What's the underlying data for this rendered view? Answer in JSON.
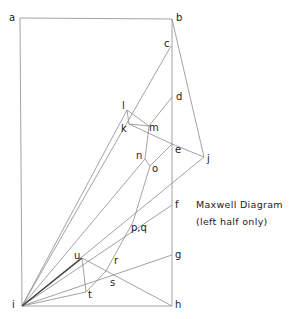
{
  "caption": {
    "title": "Maxwell Diagram",
    "subtitle": "(left half only)"
  },
  "points": {
    "a": {
      "label": "a",
      "x": 20,
      "y": 18,
      "lx": 9,
      "ly": 21
    },
    "b": {
      "label": "b",
      "x": 172,
      "y": 19,
      "lx": 176,
      "ly": 21
    },
    "c": {
      "label": "c",
      "x": 171,
      "y": 46,
      "lx": 164,
      "ly": 47
    },
    "d": {
      "label": "d",
      "x": 172,
      "y": 97,
      "lx": 176,
      "ly": 100
    },
    "e": {
      "label": "e",
      "x": 172,
      "y": 144,
      "lx": 175,
      "ly": 153
    },
    "f": {
      "label": "f",
      "x": 172,
      "y": 205,
      "lx": 175,
      "ly": 208
    },
    "g": {
      "label": "g",
      "x": 172,
      "y": 255,
      "lx": 175,
      "ly": 258
    },
    "h": {
      "label": "h",
      "x": 172,
      "y": 306,
      "lx": 175,
      "ly": 308
    },
    "i": {
      "label": "i",
      "x": 22,
      "y": 306,
      "lx": 12,
      "ly": 308
    },
    "j": {
      "label": "j",
      "x": 204,
      "y": 157,
      "lx": 207,
      "ly": 162
    },
    "k": {
      "label": "k",
      "x": 129,
      "y": 124,
      "lx": 121,
      "ly": 132
    },
    "l": {
      "label": "l",
      "x": 127,
      "y": 110,
      "lx": 122,
      "ly": 109
    },
    "m": {
      "label": "m",
      "x": 149,
      "y": 126,
      "lx": 149,
      "ly": 131
    },
    "n": {
      "label": "n",
      "x": 145,
      "y": 159,
      "lx": 136,
      "ly": 159
    },
    "o": {
      "label": "o",
      "x": 150,
      "y": 166,
      "lx": 152,
      "ly": 172
    },
    "pq": {
      "label": "p,q",
      "x": 133,
      "y": 222,
      "lx": 131,
      "ly": 231
    },
    "r": {
      "label": "r",
      "x": 105,
      "y": 268,
      "lx": 114,
      "ly": 264
    },
    "s": {
      "label": "s",
      "x": 106,
      "y": 271,
      "lx": 110,
      "ly": 286
    },
    "t": {
      "label": "t",
      "x": 86,
      "y": 292,
      "lx": 88,
      "ly": 298
    },
    "u": {
      "label": "u",
      "x": 82,
      "y": 258,
      "lx": 74,
      "ly": 259
    }
  },
  "lines": [
    [
      "a",
      "b"
    ],
    [
      "a",
      "i"
    ],
    [
      "b",
      "h"
    ],
    [
      "i",
      "h"
    ],
    [
      "b",
      "j"
    ],
    [
      "j",
      "e"
    ],
    [
      "e",
      "k"
    ],
    [
      "c",
      "i"
    ],
    [
      "d",
      "m"
    ],
    [
      "l",
      "k"
    ],
    [
      "l",
      "m"
    ],
    [
      "k",
      "m"
    ],
    [
      "l",
      "i"
    ],
    [
      "m",
      "n"
    ],
    [
      "n",
      "o"
    ],
    [
      "o",
      "e"
    ],
    [
      "n",
      "i"
    ],
    [
      "o",
      "pq"
    ],
    [
      "j",
      "i"
    ],
    [
      "f",
      "i"
    ],
    [
      "pq",
      "s"
    ],
    [
      "g",
      "i"
    ],
    [
      "h",
      "u"
    ],
    [
      "u",
      "i"
    ],
    [
      "u",
      "t"
    ],
    [
      "t",
      "i"
    ],
    [
      "t",
      "s"
    ]
  ],
  "colors": {
    "line": "#8a8a8a",
    "text": "#222222",
    "background": "#ffffff"
  }
}
